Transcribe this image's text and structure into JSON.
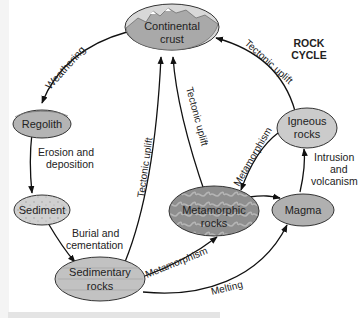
{
  "title": {
    "line1": "ROCK",
    "line2": "CYCLE"
  },
  "nodes": {
    "continental_crust": {
      "line1": "Continental",
      "line2": "crust",
      "fill": "#a9a9a9"
    },
    "regolith": {
      "line1": "Regolith",
      "fill": "#b4b4b4"
    },
    "sediment": {
      "line1": "Sediment",
      "fill": "#d3d3d3"
    },
    "sedimentary_rocks": {
      "line1": "Sedimentary",
      "line2": "rocks",
      "fill": "#c2c2c2"
    },
    "metamorphic_rocks": {
      "line1": "Metamorphic",
      "line2": "rocks",
      "fill": "#8e8e8e"
    },
    "magma": {
      "line1": "Magma",
      "fill": "#b0b0b0"
    },
    "igneous_rocks": {
      "line1": "Igneous",
      "line2": "rocks",
      "fill": "#cbcbcb"
    }
  },
  "processes": {
    "weathering": "Weathering",
    "erosion_line1": "Erosion and",
    "erosion_line2": "deposition",
    "burial_line1": "Burial and",
    "burial_line2": "cementation",
    "tectonic_uplift_sed": "Tectonic uplift",
    "tectonic_uplift_meta": "Tectonic uplift",
    "tectonic_uplift_ign": "Tectonic uplift",
    "metamorphism_sed": "Metamorphism",
    "metamorphism_ign": "Metamorphism",
    "melting": "Melting",
    "intrusion_line1": "Intrusion",
    "intrusion_line2": "and",
    "intrusion_line3": "volcanism"
  }
}
